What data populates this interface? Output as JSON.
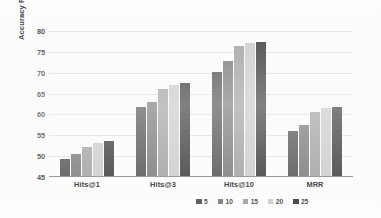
{
  "chart_data": {
    "type": "bar",
    "title": "",
    "subtitle": "",
    "xlabel": "",
    "ylabel": "Accuracy Rate(%)",
    "ylim": [
      45,
      80
    ],
    "yticks": [
      45,
      50,
      55,
      60,
      65,
      70,
      75,
      80
    ],
    "grid": true,
    "legend_position": "bottom-center",
    "categories": [
      "Hits@1",
      "Hits@3",
      "Hits@10",
      "MRR"
    ],
    "series": [
      {
        "name": "5",
        "color": "#595959",
        "values": [
          49.3,
          61.7,
          70.1,
          56.0
        ]
      },
      {
        "name": "10",
        "color": "#808080",
        "values": [
          50.5,
          63.0,
          72.8,
          57.5
        ]
      },
      {
        "name": "15",
        "color": "#a6a6a6",
        "values": [
          52.1,
          66.2,
          76.5,
          60.5
        ]
      },
      {
        "name": "20",
        "color": "#cfcfcf",
        "values": [
          53.2,
          67.1,
          77.1,
          61.6
        ]
      },
      {
        "name": "25",
        "color": "#434343",
        "values": [
          53.6,
          67.6,
          77.4,
          61.9
        ]
      }
    ]
  },
  "axis": {
    "y_title": "Accuracy Rate(%)",
    "tick_labels": [
      "80",
      "75",
      "70",
      "65",
      "60",
      "55",
      "50",
      "45"
    ]
  },
  "legend": {
    "items": [
      {
        "label": "5"
      },
      {
        "label": "10"
      },
      {
        "label": "15"
      },
      {
        "label": "20"
      },
      {
        "label": "25"
      }
    ]
  }
}
